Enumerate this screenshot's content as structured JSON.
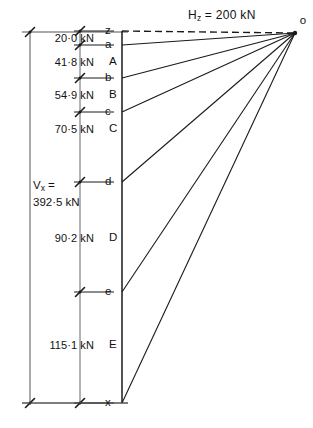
{
  "figure": {
    "type": "force-polygon",
    "title_text": "H",
    "horizontal_thrust": {
      "symbol": "H",
      "subscript": "z",
      "equals": "=",
      "value": "200 kN",
      "full_text": "H z = 200 kN"
    },
    "vertical_total": {
      "symbol": "V",
      "subscript": "x",
      "equals": "=",
      "value": "392·5 kN",
      "line1": "V x =",
      "line2": "392·5 kN"
    },
    "pole_label": "o",
    "top_node_label": "z",
    "bottom_node_label": "x"
  },
  "load_line": {
    "x": 122,
    "y_top": 31,
    "y_bottom": 403,
    "nodes": [
      {
        "label": "z",
        "y": 31,
        "tick": true,
        "ray": true,
        "dashed": true
      },
      {
        "label": "a",
        "y": 45,
        "tick": true,
        "ray": true,
        "dashed": false
      },
      {
        "label": "A",
        "y": 62,
        "tick": false,
        "ray": false,
        "dashed": false
      },
      {
        "label": "b",
        "y": 78,
        "tick": true,
        "ray": true,
        "dashed": false
      },
      {
        "label": "B",
        "y": 95,
        "tick": false,
        "ray": false,
        "dashed": false
      },
      {
        "label": "c",
        "y": 112,
        "tick": true,
        "ray": true,
        "dashed": false
      },
      {
        "label": "C",
        "y": 129,
        "tick": false,
        "ray": false,
        "dashed": false
      },
      {
        "label": "d",
        "y": 182,
        "tick": true,
        "ray": true,
        "dashed": false
      },
      {
        "label": "D",
        "y": 238,
        "tick": false,
        "ray": false,
        "dashed": false
      },
      {
        "label": "e",
        "y": 292,
        "tick": true,
        "ray": true,
        "dashed": false
      },
      {
        "label": "E",
        "y": 345,
        "tick": false,
        "ray": false,
        "dashed": false
      },
      {
        "label": "x",
        "y": 403,
        "tick": true,
        "ray": true,
        "dashed": false
      }
    ]
  },
  "pole": {
    "label": "o",
    "x": 295,
    "y": 33
  },
  "forces": [
    {
      "label": "20·0 kN",
      "y": 38,
      "between": "z-a"
    },
    {
      "label": "41·8 kN",
      "y": 62,
      "between": "a-b"
    },
    {
      "label": "54·9 kN",
      "y": 95,
      "between": "b-c"
    },
    {
      "label": "70·5 kN",
      "y": 129,
      "between": "c-d"
    },
    {
      "label": "90·2 kN",
      "y": 238,
      "between": "d-e"
    },
    {
      "label": "115·1 kN",
      "y": 345,
      "between": "e-x"
    }
  ],
  "dimension": {
    "x": 30,
    "y_top": 32,
    "y_bottom": 403,
    "label_line1": "V x =",
    "label_line2": "392·5 kN"
  },
  "chart_data": {
    "type": "line",
    "xlabel": "",
    "ylabel": "",
    "categories": [
      "z-a",
      "a-b",
      "b-c",
      "c-d",
      "d-e",
      "e-x"
    ],
    "values": [
      20.0,
      41.8,
      54.9,
      70.5,
      90.2,
      115.1
    ],
    "units": "kN",
    "annotations": [
      "H z = 200 kN",
      "V x = 392·5 kN"
    ],
    "node_labels": [
      "z",
      "a",
      "A",
      "b",
      "B",
      "c",
      "C",
      "d",
      "D",
      "e",
      "E",
      "x"
    ],
    "ray_labels": [
      "z",
      "a",
      "b",
      "c",
      "d",
      "e",
      "x"
    ],
    "pole": "o",
    "grid": false,
    "legend": "none"
  },
  "style": {
    "stroke": "#1a1a1a",
    "text": "#111111",
    "dimension_stroke": "#555555",
    "background": "#ffffff"
  }
}
